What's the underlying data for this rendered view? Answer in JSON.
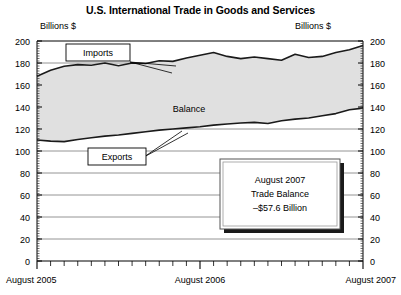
{
  "chart_data": {
    "type": "area",
    "title": "U.S. International Trade in Goods and Services",
    "xlabel": "",
    "ylabel": "Billions $",
    "ylabel_right": "Billions $",
    "ylim": [
      0,
      200
    ],
    "ytick_step": 20,
    "yticks": [
      "0",
      "20",
      "40",
      "60",
      "80",
      "100",
      "120",
      "140",
      "160",
      "180",
      "200"
    ],
    "xticks": [
      "August 2005",
      "August 2006",
      "August 2007"
    ],
    "xtick_positions": [
      0,
      12,
      24
    ],
    "x_minor_count": 24,
    "grid": true,
    "legend_position": "inline-callouts",
    "categories": [
      "Aug 2005",
      "Sep 2005",
      "Oct 2005",
      "Nov 2005",
      "Dec 2005",
      "Jan 2006",
      "Feb 2006",
      "Mar 2006",
      "Apr 2006",
      "May 2006",
      "Jun 2006",
      "Jul 2006",
      "Aug 2006",
      "Sep 2006",
      "Oct 2006",
      "Nov 2006",
      "Dec 2006",
      "Jan 2007",
      "Feb 2007",
      "Mar 2007",
      "Apr 2007",
      "May 2007",
      "Jun 2007",
      "Jul 2007",
      "Aug 2007"
    ],
    "series": [
      {
        "name": "Imports",
        "values": [
          168.0,
          173.5,
          177.0,
          178.5,
          178.0,
          180.0,
          177.5,
          180.0,
          179.5,
          182.0,
          181.5,
          184.5,
          187.0,
          189.5,
          186.0,
          184.0,
          185.5,
          184.0,
          182.5,
          188.0,
          185.0,
          186.0,
          189.5,
          192.0,
          196.0
        ]
      },
      {
        "name": "Exports",
        "values": [
          110.0,
          109.0,
          108.5,
          110.5,
          112.0,
          113.5,
          114.5,
          116.0,
          117.5,
          119.0,
          120.0,
          121.0,
          122.0,
          123.5,
          124.5,
          125.5,
          126.0,
          125.0,
          127.5,
          129.0,
          130.0,
          132.0,
          134.0,
          137.5,
          139.0
        ]
      }
    ],
    "annotations": [
      {
        "name": "imports-label",
        "text": "Imports",
        "boxed": true
      },
      {
        "name": "exports-label",
        "text": "Exports",
        "boxed": true
      },
      {
        "name": "balance-label",
        "text": "Balance",
        "boxed": false
      }
    ],
    "callout": {
      "line1": "August 2007",
      "line2": "Trade Balance",
      "line3": "–$57.6 Billion"
    },
    "colors": {
      "band_fill": "#e0e0e0",
      "line": "#1a1a1a",
      "grid": "#888888",
      "axis": "#000000",
      "background": "#ffffff"
    }
  }
}
